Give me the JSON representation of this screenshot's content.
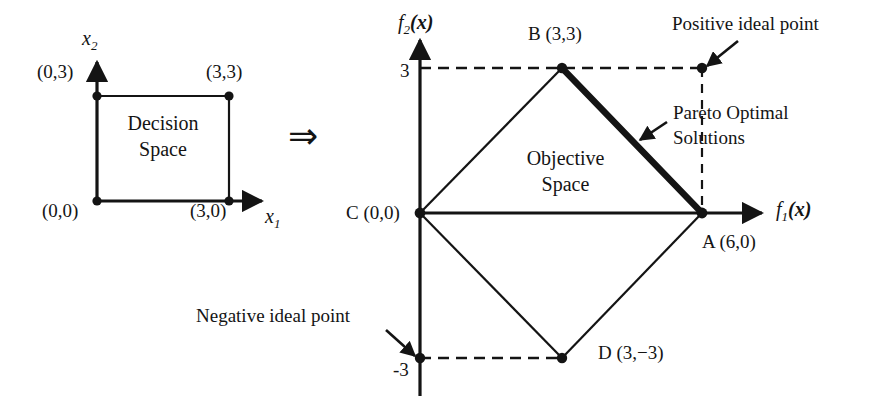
{
  "figure": {
    "type": "diagram",
    "implication_symbol": "⇒"
  },
  "decision_space": {
    "title": "Decision\nSpace",
    "title_line1": "Decision",
    "title_line2": "Space",
    "axes": {
      "x_axis_label": "x",
      "x_axis_subscript": "1",
      "y_axis_label": "x",
      "y_axis_subscript": "2"
    },
    "vertices": [
      {
        "name": "bottom-left",
        "label": "(0,0)",
        "x": 0,
        "y": 0
      },
      {
        "name": "bottom-right",
        "label": "(3,0)",
        "x": 3,
        "y": 0
      },
      {
        "name": "top-right",
        "label": "(3,3)",
        "x": 3,
        "y": 3
      },
      {
        "name": "top-left",
        "label": "(0,3)",
        "x": 0,
        "y": 3
      }
    ]
  },
  "objective_space": {
    "title_line1": "Objective",
    "title_line2": "Space",
    "axes": {
      "x_axis_label": "f",
      "x_axis_subscript": "1",
      "x_axis_arg": "(x)",
      "y_axis_label": "f",
      "y_axis_subscript": "2",
      "y_axis_arg": "(x)"
    },
    "ticks": {
      "y_positive": "3",
      "y_negative": "-3"
    },
    "vertices": [
      {
        "id": "A",
        "label": "A (6,0)",
        "f1": 6,
        "f2": 0
      },
      {
        "id": "B",
        "label": "B (3,3)",
        "f1": 3,
        "f2": 3
      },
      {
        "id": "C",
        "label": "C (0,0)",
        "f1": 0,
        "f2": 0
      },
      {
        "id": "D",
        "label": "D (3,−3)",
        "f1": 3,
        "f2": -3
      }
    ],
    "annotations": [
      {
        "id": "positive-ideal",
        "label": "Positive ideal point",
        "f1": 6,
        "f2": 3
      },
      {
        "id": "negative-ideal",
        "label": "Negative ideal point",
        "f1": 0,
        "f2": -3
      },
      {
        "id": "pareto-optimal",
        "label_line1": "Pareto Optimal",
        "label_line2": "Solutions",
        "segment_from": "B",
        "segment_to": "A"
      }
    ]
  },
  "colors": {
    "stroke": "#141414",
    "text": "#141414",
    "background": "#ffffff",
    "pareto_highlight": "#141414"
  }
}
